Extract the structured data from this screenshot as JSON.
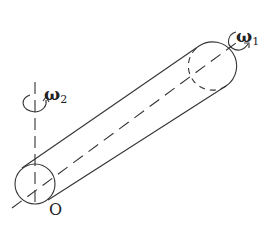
{
  "diagram": {
    "labels": {
      "omega1": "ω",
      "omega1_sub": "1",
      "omega2": "ω",
      "omega2_sub": "2",
      "origin": "O"
    },
    "colors": {
      "stroke": "#333333",
      "background": "#ffffff"
    }
  }
}
